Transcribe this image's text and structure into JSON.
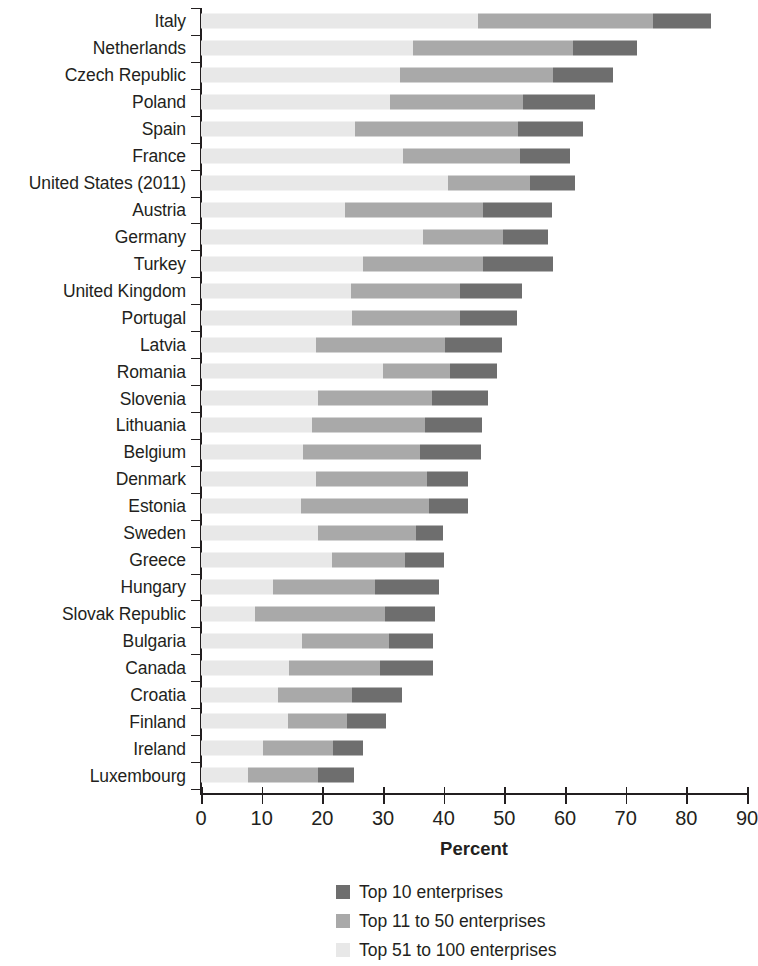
{
  "chart_data": {
    "type": "bar",
    "orientation": "horizontal",
    "stacked": true,
    "title": "",
    "xlabel": "Percent",
    "ylabel": "",
    "xlim": [
      0,
      90
    ],
    "xticks": [
      0,
      10,
      20,
      30,
      40,
      50,
      60,
      70,
      80,
      90
    ],
    "grid": false,
    "legend_position": "bottom-center",
    "categories": [
      "Italy",
      "Netherlands",
      "Czech Republic",
      "Poland",
      "Spain",
      "France",
      "United States (2011)",
      "Austria",
      "Germany",
      "Turkey",
      "United Kingdom",
      "Portugal",
      "Latvia",
      "Romania",
      "Slovenia",
      "Lithuania",
      "Belgium",
      "Denmark",
      "Estonia",
      "Sweden",
      "Greece",
      "Hungary",
      "Slovak Republic",
      "Bulgaria",
      "Canada",
      "Croatia",
      "Finland",
      "Ireland",
      "Luxembourg"
    ],
    "series": [
      {
        "name": "Top 10 enterprises",
        "color": "#6e6e6e",
        "values": [
          9.6,
          10.5,
          9.9,
          11.9,
          10.7,
          8.2,
          7.4,
          11.3,
          7.4,
          11.5,
          10.2,
          9.4,
          9.4,
          7.8,
          9.2,
          9.4,
          10.1,
          6.7,
          6.4,
          4.5,
          6.3,
          10.5,
          8.3,
          7.2,
          8.7,
          8.2,
          6.5,
          5.0,
          5.9
        ]
      },
      {
        "name": "Top 11 to 50 enterprises",
        "color": "#a9a9a9",
        "values": [
          28.9,
          26.4,
          25.2,
          21.8,
          26.8,
          19.3,
          13.5,
          22.8,
          13.2,
          19.8,
          18.0,
          17.8,
          21.3,
          11.0,
          18.8,
          18.6,
          19.3,
          18.3,
          21.1,
          16.1,
          12.1,
          16.9,
          21.4,
          14.4,
          15.0,
          12.2,
          9.7,
          11.5,
          11.6
        ]
      },
      {
        "name": "Top 51 to 100 enterprises",
        "color": "#e8e8e8",
        "values": [
          45.6,
          34.9,
          32.8,
          31.2,
          25.4,
          33.3,
          40.7,
          23.7,
          36.6,
          26.7,
          24.7,
          24.9,
          18.9,
          30.0,
          19.3,
          18.3,
          16.8,
          19.0,
          16.5,
          19.3,
          21.6,
          11.8,
          8.9,
          16.6,
          14.5,
          12.7,
          14.3,
          10.2,
          7.7
        ]
      }
    ],
    "totals": [
      84.1,
      71.8,
      67.9,
      64.9,
      62.9,
      60.8,
      61.6,
      57.8,
      57.2,
      58.0,
      52.9,
      52.1,
      49.6,
      48.8,
      47.3,
      46.3,
      46.2,
      44.0,
      44.0,
      39.9,
      40.0,
      39.2,
      38.6,
      38.2,
      38.2,
      33.1,
      30.5,
      26.7,
      25.2
    ],
    "segment_order_drawn": [
      "Top 51 to 100 enterprises",
      "Top 11 to 50 enterprises",
      "Top 10 enterprises"
    ]
  },
  "axis": {
    "x_title": "Percent",
    "x_tick_labels": [
      "0",
      "10",
      "20",
      "30",
      "40",
      "50",
      "60",
      "70",
      "80",
      "90"
    ]
  },
  "legend": {
    "items": [
      {
        "label": "Top 10 enterprises",
        "color": "#6e6e6e"
      },
      {
        "label": "Top 11 to 50 enterprises",
        "color": "#a9a9a9"
      },
      {
        "label": "Top 51 to 100 enterprises",
        "color": "#e8e8e8"
      }
    ]
  }
}
